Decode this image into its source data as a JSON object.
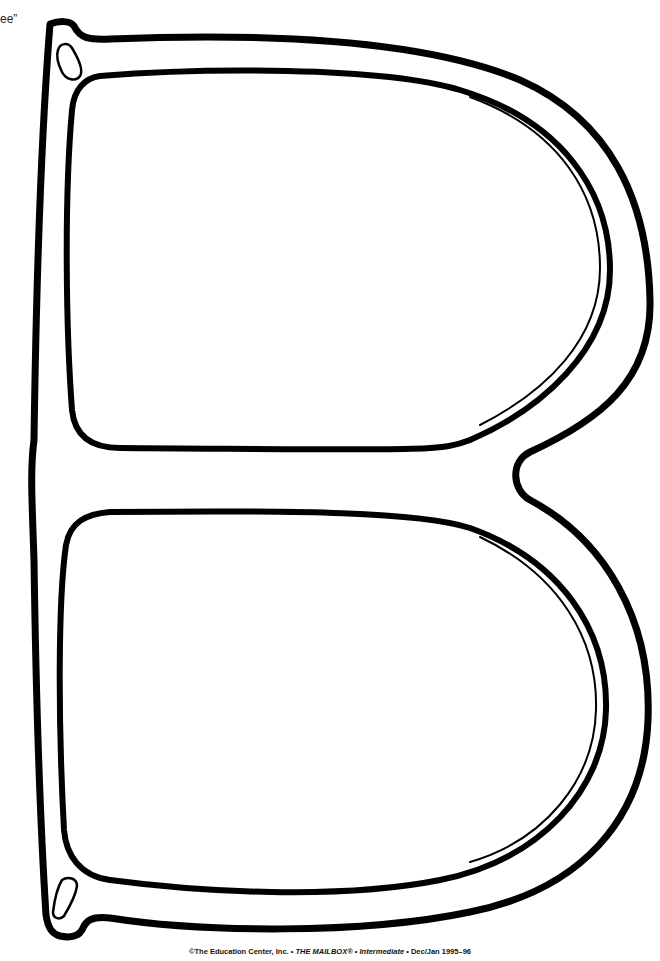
{
  "partial_text": "ee”",
  "credit": {
    "prefix": "©The Education Center, Inc. • ",
    "magazine": "THE MAILBOX®",
    "sep1": " • ",
    "edition": "Intermediate",
    "sep2": " • ",
    "issue": "Dec/Jan 1995–96"
  },
  "colors": {
    "stroke": "#000000",
    "background": "#ffffff"
  }
}
